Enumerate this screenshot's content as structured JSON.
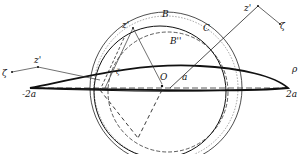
{
  "diagram": {
    "type": "Joukowski airfoil conformal mapping",
    "colors": {
      "stroke": "#111111",
      "background": "#ffffff"
    },
    "labels": {
      "zeta_left": "ζ",
      "z_prime_left": "z'",
      "z_prime_top": "z'",
      "B": "B",
      "B_double_prime": "B''",
      "C": "C",
      "z_prime_right": "z'",
      "zeta_right": "ζ",
      "zeta_inner": "ζ",
      "O": "O",
      "a": "a",
      "rho": "ρ",
      "minus_two_a": "-2a",
      "two_a": "2a"
    }
  }
}
